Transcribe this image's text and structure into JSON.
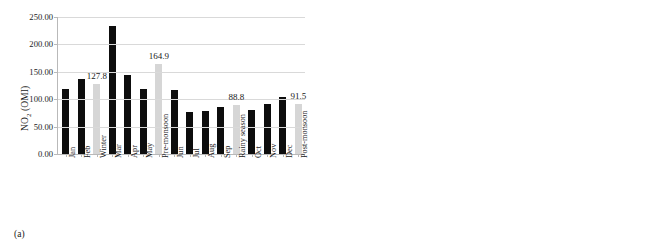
{
  "figure": {
    "panels": [
      {
        "tag": "(a)",
        "ylabel_text": "NO",
        "ylabel_sub": "2",
        "ylabel_suffix": " (OMI)"
      },
      {
        "tag": "(b)",
        "ylabel_text": "NO",
        "ylabel_sub": "2",
        "ylabel_suffix": " (SCIAMACHY)"
      }
    ]
  },
  "chart_data": [
    {
      "type": "bar",
      "title": "",
      "panel_tag": "(a)",
      "xlabel": "",
      "ylabel": "NO2 (OMI)",
      "ylim": [
        0,
        250
      ],
      "ytick_step": 50,
      "ytick_labels": [
        "0.00",
        "50.00",
        "100.00",
        "150.00",
        "200.00",
        "250.00"
      ],
      "grid": true,
      "legend": "none",
      "categories": [
        "Jan",
        "Feb",
        "Winter",
        "Mar",
        "Apr",
        "May",
        "Pre-monsoon",
        "Jun",
        "Jul",
        "Aug",
        "Sep",
        "Rainy season",
        "Oct",
        "Nov",
        "Dec",
        "Post-monsoon"
      ],
      "values": [
        118.0,
        137.0,
        127.8,
        233.0,
        144.0,
        118.0,
        164.9,
        117.0,
        76.0,
        78.0,
        85.0,
        88.8,
        81.0,
        91.0,
        104.0,
        91.5
      ],
      "series_kind": [
        "month",
        "month",
        "season",
        "month",
        "month",
        "month",
        "season",
        "month",
        "month",
        "month",
        "month",
        "season",
        "month",
        "month",
        "month",
        "season"
      ],
      "colors": {
        "month": "#0d0d0d",
        "season": "#d6d6d6"
      },
      "data_labels": [
        null,
        null,
        "127.8",
        null,
        null,
        null,
        "164.9",
        null,
        null,
        null,
        null,
        "88.8",
        null,
        null,
        null,
        "91.5"
      ]
    },
    {
      "type": "bar",
      "title": "",
      "panel_tag": "(b)",
      "xlabel": "",
      "ylabel": "NO2 (SCIAMACHY)",
      "ylim": [
        0,
        180
      ],
      "ytick_step": 20,
      "ytick_labels": [
        "0.00",
        "20.00",
        "40.00",
        "60.00",
        "80.00",
        "100.00",
        "120.00",
        "140.00",
        "160.00",
        "180.00"
      ],
      "grid": true,
      "legend": "none",
      "categories": [
        "Jan",
        "Feb",
        "Winter",
        "Mar",
        "Apr",
        "May",
        "Pre-monsoon",
        "Jun",
        "Jul",
        "Aug",
        "Sep",
        "Rainy season",
        "Oct",
        "Nov",
        "Dec",
        "Post-monsoon"
      ],
      "values": [
        99.0,
        118.0,
        108.8,
        155.0,
        120.0,
        76.0,
        117.5,
        104.0,
        81.0,
        81.0,
        83.0,
        88.2,
        65.0,
        71.0,
        77.0,
        71.5
      ],
      "series_kind": [
        "month",
        "month",
        "season",
        "month",
        "month",
        "month",
        "season",
        "month",
        "month",
        "month",
        "month",
        "season",
        "month",
        "month",
        "month",
        "season"
      ],
      "colors": {
        "month": "#0d0d0d",
        "season": "#d6d6d6"
      },
      "data_labels": [
        null,
        null,
        "108.8",
        null,
        null,
        null,
        "117.5",
        null,
        null,
        null,
        null,
        "88.2",
        null,
        null,
        null,
        "71.5"
      ]
    }
  ]
}
